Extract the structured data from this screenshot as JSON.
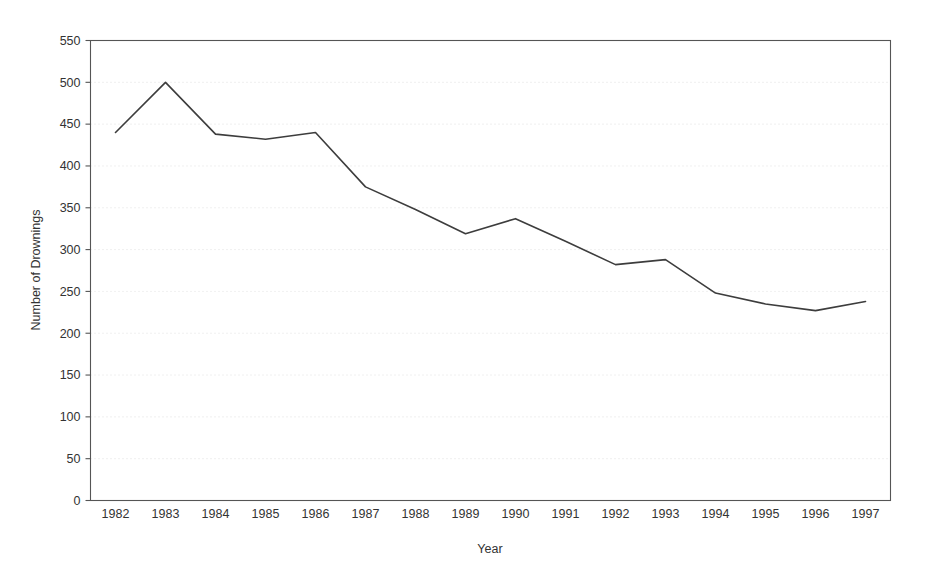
{
  "chart_data": {
    "type": "line",
    "title": "",
    "xlabel": "Year",
    "ylabel": "Number of Drownings",
    "categories": [
      "1982",
      "1983",
      "1984",
      "1985",
      "1986",
      "1987",
      "1988",
      "1989",
      "1990",
      "1991",
      "1992",
      "1993",
      "1994",
      "1995",
      "1996",
      "1997"
    ],
    "values": [
      440,
      500,
      438,
      432,
      440,
      375,
      348,
      319,
      337,
      310,
      282,
      288,
      248,
      235,
      227,
      238
    ],
    "series": [
      {
        "name": "Number of Drownings",
        "values": [
          440,
          500,
          438,
          432,
          440,
          375,
          348,
          319,
          337,
          310,
          282,
          288,
          248,
          235,
          227,
          238
        ]
      }
    ],
    "x": [
      1982,
      1983,
      1984,
      1985,
      1986,
      1987,
      1988,
      1989,
      1990,
      1991,
      1992,
      1993,
      1994,
      1995,
      1996,
      1997
    ],
    "ylim": [
      0,
      550
    ],
    "yticks": [
      0,
      50,
      100,
      150,
      200,
      250,
      300,
      350,
      400,
      450,
      500,
      550
    ],
    "ytick_labels": [
      "0",
      "50",
      "100",
      "150",
      "200",
      "250",
      "300",
      "350",
      "400",
      "450",
      "500",
      "550"
    ],
    "xtick_labels": [
      "1982",
      "1983",
      "1984",
      "1985",
      "1986",
      "1987",
      "1988",
      "1989",
      "1990",
      "1991",
      "1992",
      "1993",
      "1994",
      "1995",
      "1996",
      "1997"
    ],
    "grid": true,
    "grid_style": "dotted-horizontal",
    "legend": "none",
    "legend_position": "none",
    "annotations": [],
    "line_color": "#3d3d3d",
    "frame_color": "#555555",
    "grid_color": "#d9d9d9",
    "background_color": "#ffffff"
  },
  "plot": {
    "x_axis_title": "Year",
    "y_axis_title": "Number of Drownings"
  }
}
